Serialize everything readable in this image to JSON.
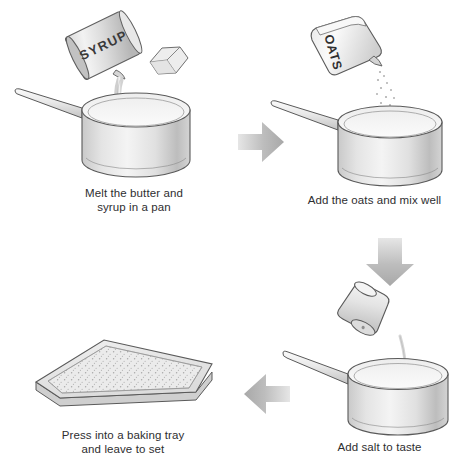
{
  "background_color": "#ffffff",
  "text_color": "#2e2e30",
  "arrow_color": "#b9b9b9",
  "steps": [
    {
      "id": "step-1",
      "number": 1,
      "caption": "Melt the butter and\nsyrup in a pan",
      "objects": [
        "saucepan",
        "syrup-tin",
        "butter-cube",
        "syrup-stream"
      ],
      "labels": {
        "tin_label": "SYRUP"
      }
    },
    {
      "id": "step-2",
      "number": 2,
      "caption": "Add the oats and mix well",
      "objects": [
        "saucepan",
        "oats-bag",
        "oats-stream"
      ],
      "labels": {
        "bag_label": "OATS"
      }
    },
    {
      "id": "step-3",
      "number": 3,
      "caption": "Add salt to taste",
      "objects": [
        "saucepan",
        "salt-shaker",
        "salt-stream"
      ],
      "labels": {}
    },
    {
      "id": "step-4",
      "number": 4,
      "caption": "Press into a baking tray\nand leave to set",
      "objects": [
        "baking-tray",
        "oat-mixture"
      ],
      "labels": {}
    }
  ],
  "arrows": [
    {
      "id": "arrow-1",
      "direction": "right",
      "from": "step-1",
      "to": "step-2"
    },
    {
      "id": "arrow-2",
      "direction": "down",
      "from": "step-2",
      "to": "step-3"
    },
    {
      "id": "arrow-3",
      "direction": "left",
      "from": "step-3",
      "to": "step-4"
    }
  ]
}
